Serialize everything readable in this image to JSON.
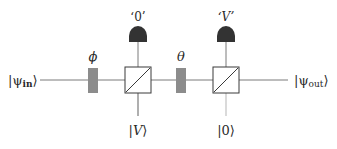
{
  "diagram": {
    "input_state": {
      "prefix": "|ψ",
      "sub": "in",
      "suffix": "⟩"
    },
    "output_state": {
      "prefix": "|ψ",
      "sub": "out",
      "suffix": "⟩"
    },
    "phase_shifter_1": {
      "label": "ϕ"
    },
    "phase_shifter_2": {
      "label": "θ"
    },
    "detector_1": {
      "label": "‘0’"
    },
    "detector_2": {
      "label": "‘V’"
    },
    "ancilla_1": {
      "label_open": "|",
      "label_mid": "V",
      "label_close": "⟩"
    },
    "ancilla_2": {
      "label": "|0⟩"
    },
    "colors": {
      "line": "#7a7a7a",
      "box_stroke": "#3a3a3a",
      "phase_fill": "#8c8c8c",
      "detector_fill": "#333333",
      "text": "#2a2a2a"
    }
  }
}
